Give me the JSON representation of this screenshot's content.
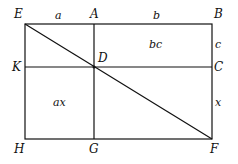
{
  "diagram": {
    "points": {
      "E": "E",
      "A": "A",
      "B": "B",
      "K": "K",
      "D": "D",
      "C": "C",
      "H": "H",
      "G": "G",
      "F": "F"
    },
    "segment_labels": {
      "EA": "a",
      "AB": "b",
      "BC": "c",
      "CF": "x"
    },
    "region_labels": {
      "upper_right": "bc",
      "lower_left": "ax"
    },
    "line_color": "#111111"
  }
}
